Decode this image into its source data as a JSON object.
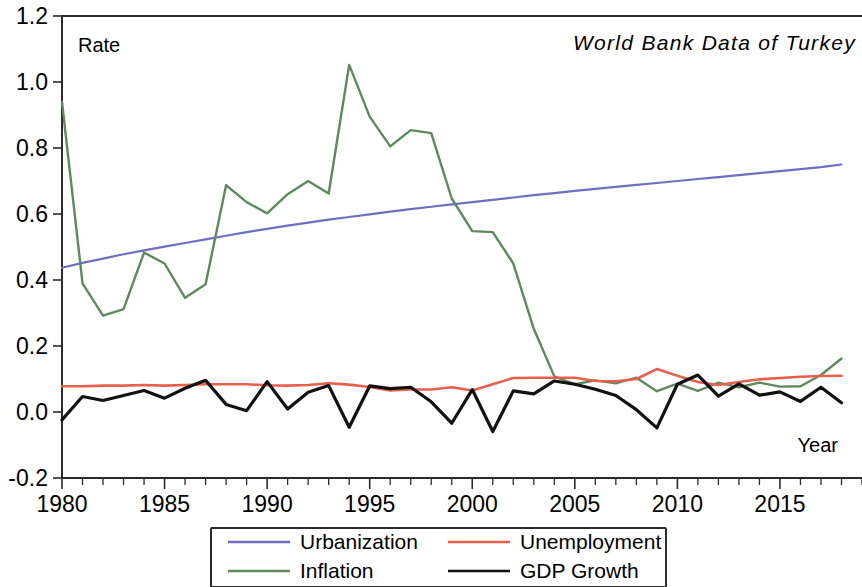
{
  "chart_data": {
    "type": "line",
    "title": "World Bank Data of Turkey",
    "xlabel": "Year",
    "ylabel": "Rate",
    "xlim": [
      1980,
      2019
    ],
    "ylim": [
      -0.2,
      1.2
    ],
    "grid": false,
    "legend_position": "bottom",
    "y_ticks": [
      "-0.2",
      "0.0",
      "0.2",
      "0.4",
      "0.6",
      "0.8",
      "1.0",
      "1.2"
    ],
    "y_tick_values": [
      -0.2,
      0.0,
      0.2,
      0.4,
      0.6,
      0.8,
      1.0,
      1.2
    ],
    "x_ticks": [
      "1980",
      "1985",
      "1990",
      "1995",
      "2000",
      "2005",
      "2010",
      "2015"
    ],
    "x_tick_values": [
      1980,
      1985,
      1990,
      1995,
      2000,
      2005,
      2010,
      2015
    ],
    "x_minor_step": 1,
    "x": [
      1980,
      1981,
      1982,
      1983,
      1984,
      1985,
      1986,
      1987,
      1988,
      1989,
      1990,
      1991,
      1992,
      1993,
      1994,
      1995,
      1996,
      1997,
      1998,
      1999,
      2000,
      2001,
      2002,
      2003,
      2004,
      2005,
      2006,
      2007,
      2008,
      2009,
      2010,
      2011,
      2012,
      2013,
      2014,
      2015,
      2016,
      2017,
      2018
    ],
    "series": [
      {
        "name": "Urbanization",
        "color": "#6f6fc2",
        "values": [
          0.437,
          0.452,
          0.465,
          0.478,
          0.49,
          0.501,
          0.512,
          0.523,
          0.534,
          0.545,
          0.555,
          0.565,
          0.574,
          0.583,
          0.591,
          0.599,
          0.607,
          0.615,
          0.622,
          0.629,
          0.636,
          0.643,
          0.65,
          0.657,
          0.663,
          0.67,
          0.676,
          0.682,
          0.688,
          0.694,
          0.7,
          0.706,
          0.712,
          0.718,
          0.724,
          0.73,
          0.736,
          0.742,
          0.75
        ]
      },
      {
        "name": "Inflation",
        "color": "#5d8a5d",
        "values": [
          0.94,
          0.39,
          0.292,
          0.312,
          0.483,
          0.45,
          0.346,
          0.387,
          0.687,
          0.636,
          0.602,
          0.66,
          0.7,
          0.662,
          1.052,
          0.895,
          0.805,
          0.854,
          0.845,
          0.647,
          0.548,
          0.545,
          0.45,
          0.252,
          0.108,
          0.084,
          0.096,
          0.087,
          0.104,
          0.063,
          0.086,
          0.064,
          0.089,
          0.075,
          0.089,
          0.077,
          0.078,
          0.112,
          0.162
        ]
      },
      {
        "name": "Unemployment",
        "color": "#e8604c",
        "values": [
          0.078,
          0.078,
          0.08,
          0.08,
          0.082,
          0.08,
          0.082,
          0.084,
          0.084,
          0.084,
          0.081,
          0.08,
          0.082,
          0.087,
          0.083,
          0.076,
          0.065,
          0.068,
          0.068,
          0.075,
          0.065,
          0.084,
          0.103,
          0.104,
          0.104,
          0.104,
          0.094,
          0.093,
          0.1,
          0.13,
          0.11,
          0.091,
          0.082,
          0.091,
          0.099,
          0.103,
          0.107,
          0.109,
          0.11
        ]
      },
      {
        "name": "GDP Growth",
        "color": "#111111",
        "values": [
          -0.024,
          0.047,
          0.035,
          0.05,
          0.065,
          0.042,
          0.072,
          0.096,
          0.023,
          0.004,
          0.092,
          0.009,
          0.06,
          0.08,
          -0.046,
          0.079,
          0.071,
          0.075,
          0.031,
          -0.034,
          0.068,
          -0.059,
          0.064,
          0.055,
          0.094,
          0.084,
          0.069,
          0.05,
          0.007,
          -0.048,
          0.084,
          0.112,
          0.048,
          0.085,
          0.051,
          0.061,
          0.032,
          0.075,
          0.028
        ]
      }
    ]
  },
  "annotations": {
    "rate_label": "Rate",
    "year_label": "Year",
    "title": "World Bank Data of Turkey"
  },
  "legend": {
    "items": [
      {
        "label": "Urbanization",
        "color": "#6f6fc2"
      },
      {
        "label": "Unemployment",
        "color": "#e8604c"
      },
      {
        "label": "Inflation",
        "color": "#5d8a5d"
      },
      {
        "label": "GDP Growth",
        "color": "#111111"
      }
    ]
  }
}
